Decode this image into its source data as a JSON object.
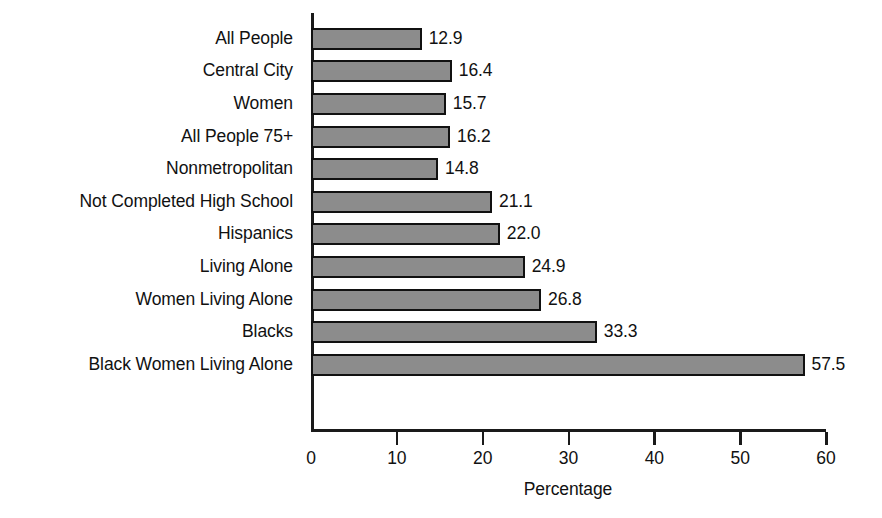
{
  "chart_data": {
    "type": "bar",
    "orientation": "horizontal",
    "title": "",
    "xlabel": "Percentage",
    "ylabel": "",
    "xlim": [
      0,
      60
    ],
    "xticks": [
      0,
      10,
      20,
      30,
      40,
      50,
      60
    ],
    "grid": false,
    "legend": null,
    "bar_color": "#8c8c8c",
    "bar_edge_color": "#111111",
    "categories": [
      "All People",
      "Central City",
      "Women",
      "All People 75+",
      "Nonmetropolitan",
      "Not Completed High School",
      "Hispanics",
      "Living Alone",
      "Women Living Alone",
      "Blacks",
      "Black Women Living Alone"
    ],
    "values": [
      12.9,
      16.4,
      15.7,
      16.2,
      14.8,
      21.1,
      22.0,
      24.9,
      26.8,
      33.3,
      57.5
    ],
    "value_labels": [
      "12.9",
      "16.4",
      "15.7",
      "16.2",
      "14.8",
      "21.1",
      "22.0",
      "24.9",
      "26.8",
      "33.3",
      "57.5"
    ],
    "xtick_labels": [
      "0",
      "10",
      "20",
      "30",
      "40",
      "50",
      "60"
    ]
  }
}
